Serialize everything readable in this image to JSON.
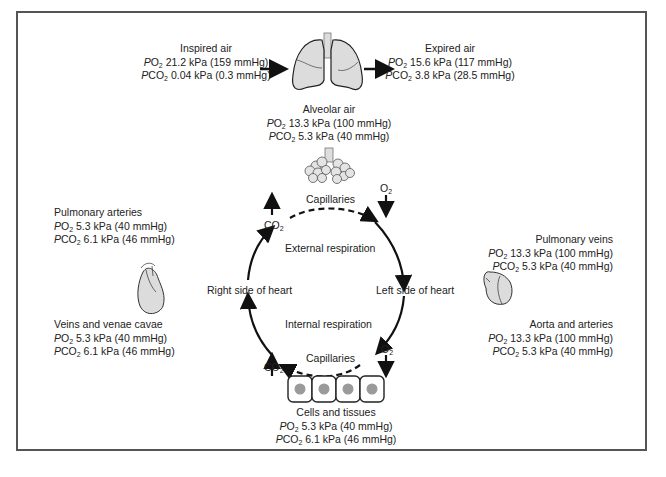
{
  "diagram": {
    "title": "",
    "nodes": {
      "inspired_air": {
        "title": "Inspired air",
        "po2": "21.2 kPa (159 mmHg)",
        "pco2": "0.04 kPa (0.3 mmHg)"
      },
      "expired_air": {
        "title": "Expired air",
        "po2": "15.6 kPa (117 mmHg)",
        "pco2": "3.8 kPa (28.5 mmHg)"
      },
      "alveolar_air": {
        "title": "Alveolar air",
        "po2": "13.3 kPa (100 mmHg)",
        "pco2": "5.3 kPa (40 mmHg)"
      },
      "pulmonary_arteries": {
        "title": "Pulmonary arteries",
        "po2": "5.3 kPa (40 mmHg)",
        "pco2": "6.1 kPa (46 mmHg)"
      },
      "veins_venae_cavae": {
        "title": "Veins and venae cavae",
        "po2": "5.3 kPa (40 mmHg)",
        "pco2": "6.1 kPa (46 mmHg)"
      },
      "pulmonary_veins": {
        "title": "Pulmonary veins",
        "po2": "13.3 kPa (100 mmHg)",
        "pco2": "5.3 kPa (40 mmHg)"
      },
      "aorta_arteries": {
        "title": "Aorta and arteries",
        "po2": "13.3 kPa (100 mmHg)",
        "pco2": "5.3 kPa (40 mmHg)"
      },
      "cells_tissues": {
        "title": "Cells and tissues",
        "po2": "5.3 kPa (40 mmHg)",
        "pco2": "6.1 kPa (46 mmHg)"
      }
    },
    "cycle_labels": {
      "capillaries_top": "Capillaries",
      "capillaries_bottom": "Capillaries",
      "external_respiration": "External respiration",
      "internal_respiration": "Internal respiration",
      "right_heart": "Right side of heart",
      "left_heart": "Left side of heart"
    },
    "gas_labels": {
      "po2_prefix": "P",
      "pco2_prefix": "P",
      "o2": "O",
      "co2": "CO",
      "sub2": "2"
    },
    "icons": [
      "lungs-icon",
      "alveoli-icon",
      "heart-right-icon",
      "heart-left-icon",
      "cells-icon"
    ],
    "colors": {
      "line": "#111111",
      "organ_fill": "#dcdcdc",
      "cell_nucleus": "#9a9a9a",
      "border": "#555555"
    }
  }
}
